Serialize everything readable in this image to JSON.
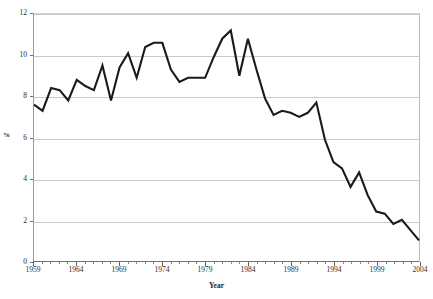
{
  "chart_data": {
    "type": "line",
    "title": "",
    "xlabel": "Year",
    "ylabel": "%",
    "xlim": [
      1959,
      2004
    ],
    "ylim": [
      0,
      12
    ],
    "grid": true,
    "legend": "none",
    "y_ticks": [
      0,
      2,
      4,
      6,
      8,
      10,
      12
    ],
    "y_tick_labels": [
      "0",
      "2",
      "4",
      "6",
      "8",
      "10",
      "12"
    ],
    "x_ticks": [
      1959,
      1964,
      1969,
      1974,
      1979,
      1984,
      1989,
      1994,
      1999,
      2004
    ],
    "x_tick_labels": [
      "1959",
      "1964",
      "1969",
      "1974",
      "1979",
      "1984",
      "1989",
      "1994",
      "1999",
      "2004"
    ],
    "x_minor_tick_interval": 1,
    "series": [
      {
        "name": "",
        "color": "#1a1a1a",
        "x": [
          1959,
          1960,
          1961,
          1962,
          1963,
          1964,
          1965,
          1966,
          1967,
          1968,
          1969,
          1970,
          1971,
          1972,
          1973,
          1974,
          1975,
          1976,
          1977,
          1978,
          1979,
          1980,
          1981,
          1982,
          1983,
          1984,
          1985,
          1986,
          1987,
          1988,
          1989,
          1990,
          1991,
          1992,
          1993,
          1994,
          1995,
          1996,
          1997,
          1998,
          1999,
          2000,
          2001,
          2002,
          2003,
          2004
        ],
        "values": [
          7.6,
          7.3,
          8.4,
          8.3,
          7.8,
          8.8,
          8.5,
          8.3,
          9.5,
          7.8,
          9.4,
          10.1,
          8.9,
          10.4,
          10.6,
          10.6,
          9.3,
          8.7,
          8.9,
          8.9,
          8.9,
          9.9,
          10.8,
          11.2,
          9.0,
          10.8,
          9.3,
          7.9,
          7.1,
          7.3,
          7.2,
          7.0,
          7.2,
          7.7,
          5.9,
          4.8,
          4.5,
          3.6,
          4.3,
          3.2,
          2.4,
          2.3,
          1.8,
          2.0,
          1.5,
          1.0
        ]
      }
    ]
  },
  "axis": {
    "y_title": "%",
    "x_title": "Year"
  }
}
